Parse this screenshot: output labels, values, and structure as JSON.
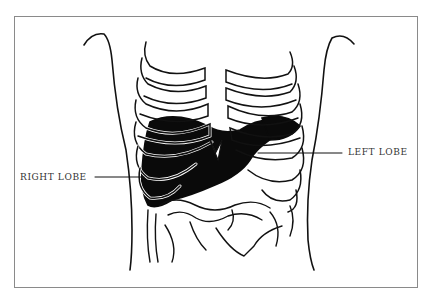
{
  "diagram": {
    "labels": {
      "right_lobe": "RIGHT LOBE",
      "left_lobe": "LEFT LOBE"
    },
    "colors": {
      "ink": "#111111",
      "liver_fill": "#0a0a0a",
      "frame_border": "#8a8a8a",
      "background": "#ffffff"
    }
  }
}
